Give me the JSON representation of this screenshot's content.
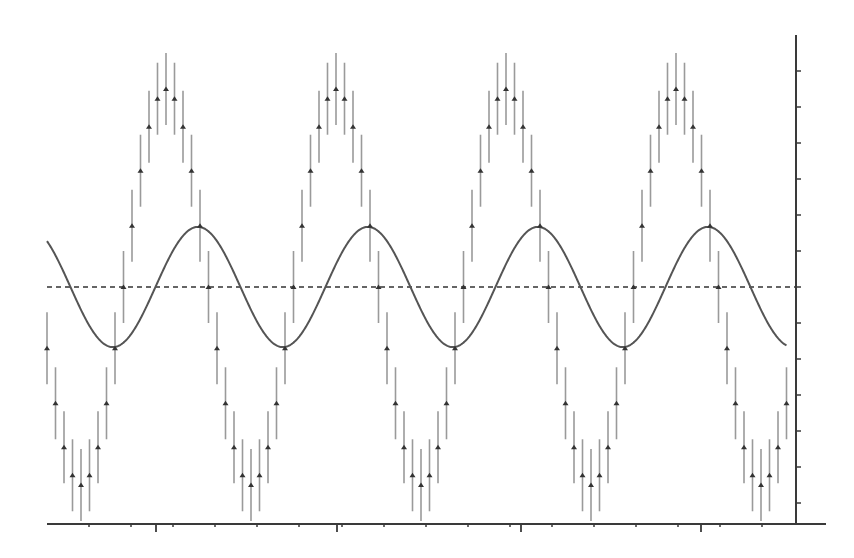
{
  "chart_data": {
    "type": "scatter",
    "title": "",
    "xlabel": "",
    "ylabel": "",
    "grid": false,
    "legend": null,
    "xlim": [
      0,
      87
    ],
    "ylim": [
      -6.6,
      7
    ],
    "x_tick_labels": [],
    "y_tick_labels": [],
    "y_ticks": [
      -6,
      -5,
      -4,
      -3,
      -2,
      -1,
      0,
      1,
      2,
      3,
      4,
      5,
      6
    ],
    "series": [
      {
        "name": "measurements",
        "style": "triangle markers with vertical error bars",
        "error": 1.0,
        "x": [
          0,
          1,
          2,
          3,
          4,
          5,
          6,
          7,
          8,
          9,
          10,
          11,
          12,
          13,
          14,
          15,
          16,
          17,
          18,
          19,
          20,
          21,
          22,
          23,
          24,
          25,
          26,
          27,
          28,
          29,
          30,
          31,
          32,
          33,
          34,
          35,
          36,
          37,
          38,
          39,
          40,
          41,
          42,
          43,
          44,
          45,
          46,
          47,
          48,
          49,
          50,
          51,
          52,
          53,
          54,
          55,
          56,
          57,
          58,
          59,
          60,
          61,
          62,
          63,
          64,
          65,
          66,
          67,
          68,
          69,
          70,
          71,
          72,
          73,
          74,
          75,
          76,
          77,
          78,
          79,
          80,
          81,
          82,
          83,
          84,
          85,
          86,
          87
        ],
        "values": [
          -1.7,
          -3.23,
          -4.45,
          -5.23,
          -5.5,
          -5.23,
          -4.45,
          -3.23,
          -1.7,
          0,
          1.7,
          3.23,
          4.45,
          5.23,
          5.5,
          5.23,
          4.45,
          3.23,
          1.7,
          0,
          -1.7,
          -3.23,
          -4.45,
          -5.23,
          -5.5,
          -5.23,
          -4.45,
          -3.23,
          -1.7,
          0,
          1.7,
          3.23,
          4.45,
          5.23,
          5.5,
          5.23,
          4.45,
          3.23,
          1.7,
          0,
          -1.7,
          -3.23,
          -4.45,
          -5.23,
          -5.5,
          -5.23,
          -4.45,
          -3.23,
          -1.7,
          0,
          1.7,
          3.23,
          4.45,
          5.23,
          5.5,
          5.23,
          4.45,
          3.23,
          1.7,
          0,
          -1.7,
          -3.23,
          -4.45,
          -5.23,
          -5.5,
          -5.23,
          -4.45,
          -3.23,
          -1.7,
          0,
          1.7,
          3.23,
          4.45,
          5.23,
          5.5,
          5.23,
          4.45,
          3.23,
          1.7,
          0,
          -1.7,
          -3.23,
          -4.45,
          -5.23,
          -5.5,
          -5.23,
          -4.45,
          -3.23
        ]
      },
      {
        "name": "model",
        "style": "solid line",
        "function": "sinusoid",
        "amplitude": 1.67,
        "period": 20,
        "trough_at": 7.76,
        "x_range": [
          0,
          87
        ]
      },
      {
        "name": "baseline",
        "style": "dashed line",
        "value": 0
      }
    ]
  },
  "render": {
    "plot_left_px": 47,
    "plot_right_px": 796,
    "x_step_px": 8.5,
    "zero_y_px": 287,
    "unit_px": 36,
    "axis_top_px": 35,
    "axis_bottom_px": 524,
    "axis_x_end_px": 826,
    "x_minor_ticks_px": [
      89,
      131,
      173,
      215,
      257,
      299,
      342,
      384,
      426,
      468,
      510,
      552,
      594,
      636,
      678,
      720,
      762
    ],
    "x_major_ticks_px": [
      156,
      337,
      521,
      701
    ],
    "colors": {
      "axis": "#3a3a3a",
      "points": "#333333",
      "error_bars": "#9a9a9a",
      "model": "#555555",
      "baseline": "#333333"
    }
  }
}
